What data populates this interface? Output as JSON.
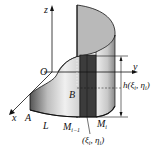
{
  "figure": {
    "labels": {
      "z_axis": "z",
      "y_axis": "y",
      "x_axis": "x",
      "origin": "O",
      "point_A": "A",
      "point_B": "B",
      "curve_L": "L",
      "M_prev": "M",
      "M_prev_sub": "i−1",
      "M_i": "M",
      "M_i_sub": "i",
      "height": "h(ξ",
      "height_sub1": "i",
      "height_mid": ", η",
      "height_sub2": "i",
      "height_end": ")",
      "point_xi": "(ξ",
      "point_xi_sub1": "i",
      "point_xi_mid": ", η",
      "point_xi_sub2": "i",
      "point_xi_end": ")"
    },
    "colors": {
      "surface_light": "#e8e8e8",
      "surface_mid": "#b0b0b0",
      "surface_dark": "#6a6a6a",
      "strip": "#3a3a3a",
      "line": "#111111"
    }
  }
}
